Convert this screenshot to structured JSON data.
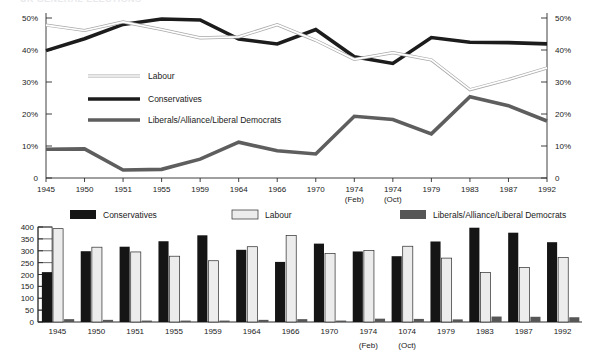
{
  "figure": {
    "clipped_header": "UK GENERAL ELECTIONS"
  },
  "line_chart": {
    "legend": [
      {
        "label": "Labour",
        "key": "labour"
      },
      {
        "label": "Conservatives",
        "key": "conservatives"
      },
      {
        "label": "Liberals/Alliance/Liberal Democrats",
        "key": "liberal"
      }
    ],
    "y_axis_left": [
      "50%",
      "40%",
      "30%",
      "20%",
      "10%",
      "0"
    ],
    "y_axis_right": [
      "50%",
      "40%",
      "30%",
      "20%",
      "10%",
      "0"
    ],
    "x_labels": [
      "1945",
      "1950",
      "1951",
      "1955",
      "1959",
      "1964",
      "1966",
      "1970",
      "1974",
      "1974",
      "1979",
      "1983",
      "1987",
      "1992"
    ],
    "x_sublabels": [
      "",
      "",
      "",
      "",
      "",
      "",
      "",
      "",
      "(Feb)",
      "(Oct)",
      "",
      "",
      "",
      ""
    ]
  },
  "bar_chart": {
    "legend": [
      {
        "label": "Conservatives",
        "key": "conservatives"
      },
      {
        "label": "Labour",
        "key": "labour"
      },
      {
        "label": "Liberals/Alliance/Liberal Democrats",
        "key": "liberal"
      }
    ],
    "y_axis": [
      "400",
      "350",
      "300",
      "250",
      "200",
      "150",
      "100",
      "50",
      "0"
    ],
    "x_labels": [
      "1945",
      "1950",
      "1951",
      "1955",
      "1959",
      "1964",
      "1966",
      "1970",
      "1974",
      "1074",
      "1979",
      "1983",
      "1987",
      "1992"
    ],
    "x_sublabels": [
      "",
      "",
      "",
      "",
      "",
      "",
      "",
      "",
      "(Feb)",
      "(Oct)",
      "",
      "",
      "",
      ""
    ]
  },
  "colors": {
    "conservative": "#151515",
    "labour": "#ececec",
    "liberal": "#565656",
    "axis": "#2b2b2b"
  },
  "chart_data": [
    {
      "type": "line",
      "title": "Share of vote at UK general elections",
      "xlabel": "",
      "ylabel": "",
      "ylim": [
        0,
        50
      ],
      "yticks": [
        0,
        10,
        20,
        30,
        40,
        50
      ],
      "ytick_labels": [
        "0",
        "10%",
        "20%",
        "30%",
        "40%",
        "50%"
      ],
      "grid": false,
      "legend_position": "inside-left",
      "x": [
        "1945",
        "1950",
        "1951",
        "1955",
        "1959",
        "1964",
        "1966",
        "1970",
        "1974 (Feb)",
        "1974 (Oct)",
        "1979",
        "1983",
        "1987",
        "1992"
      ],
      "series": [
        {
          "name": "Labour",
          "values": [
            47.8,
            46.1,
            48.8,
            46.4,
            43.8,
            44.1,
            47.9,
            43.0,
            37.1,
            39.2,
            36.9,
            27.6,
            30.8,
            34.4
          ]
        },
        {
          "name": "Conservatives",
          "values": [
            39.8,
            43.5,
            48.0,
            49.7,
            49.4,
            43.4,
            41.9,
            46.4,
            37.9,
            35.8,
            43.9,
            42.4,
            42.3,
            41.9
          ]
        },
        {
          "name": "Liberals/Alliance/Liberal Democrats",
          "values": [
            9.0,
            9.1,
            2.5,
            2.7,
            5.9,
            11.2,
            8.5,
            7.5,
            19.3,
            18.3,
            13.8,
            25.4,
            22.6,
            17.8
          ]
        }
      ]
    },
    {
      "type": "bar",
      "title": "Seats won at UK general elections",
      "xlabel": "",
      "ylabel": "",
      "ylim": [
        0,
        400
      ],
      "yticks": [
        0,
        50,
        100,
        150,
        200,
        250,
        300,
        350,
        400
      ],
      "grid": false,
      "legend_position": "top",
      "categories": [
        "1945",
        "1950",
        "1951",
        "1955",
        "1959",
        "1964",
        "1966",
        "1970",
        "1974 (Feb)",
        "1974 (Oct)",
        "1979",
        "1983",
        "1987",
        "1992"
      ],
      "series": [
        {
          "name": "Conservatives",
          "values": [
            210,
            298,
            317,
            340,
            365,
            304,
            253,
            330,
            297,
            277,
            339,
            397,
            376,
            336
          ]
        },
        {
          "name": "Labour",
          "values": [
            393,
            315,
            295,
            277,
            258,
            317,
            364,
            288,
            301,
            319,
            269,
            209,
            229,
            271
          ]
        },
        {
          "name": "Liberals/Alliance/Liberal Democrats",
          "values": [
            12,
            9,
            6,
            6,
            6,
            9,
            12,
            6,
            14,
            13,
            11,
            23,
            22,
            20
          ]
        }
      ]
    }
  ]
}
